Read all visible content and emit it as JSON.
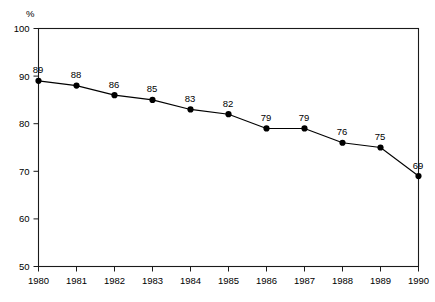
{
  "chart_data": {
    "type": "line",
    "title": "",
    "subtitle": "",
    "xlabel": "",
    "ylabel": "%",
    "unit_label": "%",
    "categories": [
      "1980",
      "1981",
      "1982",
      "1983",
      "1984",
      "1985",
      "1986",
      "1987",
      "1988",
      "1989",
      "1990"
    ],
    "x": [
      1980,
      1981,
      1982,
      1983,
      1984,
      1985,
      1986,
      1987,
      1988,
      1989,
      1990
    ],
    "values": [
      89,
      88,
      86,
      85,
      83,
      82,
      79,
      79,
      76,
      75,
      69
    ],
    "point_labels": [
      "89",
      "88",
      "86",
      "85",
      "83",
      "82",
      "79",
      "79",
      "76",
      "75",
      "69"
    ],
    "series": [
      {
        "name": "",
        "values": [
          89,
          88,
          86,
          85,
          83,
          82,
          79,
          79,
          76,
          75,
          69
        ],
        "color": "#000000",
        "marker": "filled-circle"
      }
    ],
    "ylim": [
      50,
      100
    ],
    "xlim": [
      1980,
      1990
    ],
    "yticks": [
      50,
      60,
      70,
      80,
      90,
      100
    ],
    "ytick_labels": [
      "50",
      "60",
      "70",
      "80",
      "90",
      "100"
    ],
    "xticks": [
      1980,
      1981,
      1982,
      1983,
      1984,
      1985,
      1986,
      1987,
      1988,
      1989,
      1990
    ],
    "xtick_labels": [
      "1980",
      "1981",
      "1982",
      "1983",
      "1984",
      "1985",
      "1986",
      "1987",
      "1988",
      "1989",
      "1990"
    ],
    "grid": false,
    "legend": false,
    "legend_position": "none",
    "frame": "box",
    "background_color": "#ffffff",
    "axis_color": "#1a1a1a",
    "line_color": "#000000",
    "marker_color": "#000000"
  }
}
